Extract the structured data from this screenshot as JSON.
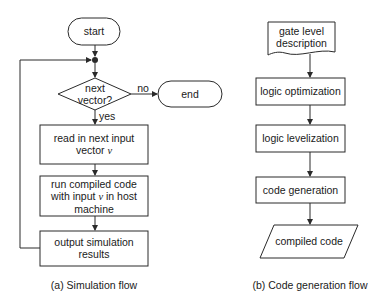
{
  "diagram": {
    "simulation_flow": {
      "caption": "(a) Simulation flow",
      "nodes": {
        "start": "start",
        "decision": {
          "line1": "next",
          "line2": "vector?"
        },
        "end": "end",
        "read": {
          "line1": "read in next input",
          "line2_prefix": "vector ",
          "var": "v"
        },
        "run": {
          "line1": "run compiled code",
          "line2_prefix": "with input ",
          "var": "v",
          "line2_suffix": " in host",
          "line3": "machine"
        },
        "output": {
          "line1": "output simulation",
          "line2": "results"
        }
      },
      "edge_labels": {
        "no": "no",
        "yes": "yes"
      }
    },
    "code_generation_flow": {
      "caption": "(b) Code generation flow",
      "nodes": {
        "input_doc": {
          "line1": "gate level",
          "line2": "description"
        },
        "optimization": "logic optimization",
        "levelization": "logic levelization",
        "codegen": "code generation",
        "output_data": "compiled code"
      }
    }
  },
  "colors": {
    "stroke": "#2a2a2a",
    "text": "#1a1a1a",
    "background": "#ffffff"
  }
}
